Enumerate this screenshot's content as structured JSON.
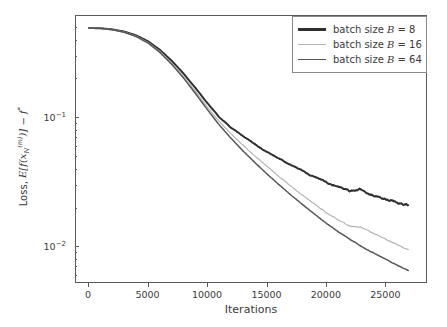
{
  "chart_data": {
    "type": "line",
    "title": "",
    "xlabel": "Iterations",
    "ylabel": "Loss, E[f(x_N^(m))] - f*",
    "ylabel_parts": {
      "prefix": "Loss, ",
      "expectation": "E",
      "fn": "f",
      "var": "x",
      "var_sub": "N",
      "var_sup": "(m)",
      "minus": " − ",
      "optimum": "f",
      "optimum_sup": "*"
    },
    "xscale": "linear",
    "yscale": "log",
    "xlim": [
      -1100,
      28500
    ],
    "ylim": [
      0.0052,
      0.62
    ],
    "grid": false,
    "legend_position": "upper right",
    "xticks": [
      0,
      5000,
      10000,
      15000,
      20000,
      25000
    ],
    "xticklabels": [
      "0",
      "5000",
      "10000",
      "15000",
      "20000",
      "25000"
    ],
    "yticks": [
      0.1,
      0.01
    ],
    "yticklabels": [
      "10−1",
      "10−2"
    ],
    "yticklabel_base": "10",
    "ytick_exponents": [
      "-1",
      "-2"
    ],
    "yminorticks": [
      0.5,
      0.4,
      0.3,
      0.2,
      0.09,
      0.08,
      0.07,
      0.06,
      0.05,
      0.04,
      0.03,
      0.02,
      0.009,
      0.008,
      0.007,
      0.006
    ],
    "series": [
      {
        "name": "batch size B = 8",
        "label_prefix": "batch size ",
        "label_symbol": "B",
        "label_suffix": " = 8",
        "color": "#2f2f2f",
        "width": 2.0,
        "x": [
          0,
          1000,
          2000,
          3000,
          4000,
          5000,
          6000,
          7000,
          8000,
          9000,
          10000,
          11000,
          12000,
          13000,
          14000,
          15000,
          16000,
          17000,
          18000,
          19000,
          20000,
          21000,
          22000,
          23000,
          24000,
          25000,
          26000,
          27000
        ],
        "y": [
          0.5,
          0.497,
          0.487,
          0.468,
          0.437,
          0.393,
          0.337,
          0.277,
          0.22,
          0.17,
          0.13,
          0.101,
          0.0835,
          0.072,
          0.062,
          0.054,
          0.048,
          0.0432,
          0.0385,
          0.0347,
          0.0315,
          0.0288,
          0.0268,
          0.0272,
          0.0248,
          0.0232,
          0.0218,
          0.0207
        ]
      },
      {
        "name": "batch size B = 16",
        "label_prefix": "batch size ",
        "label_symbol": "B",
        "label_suffix": " = 16",
        "color": "#b4b4b4",
        "width": 1.2,
        "x": [
          0,
          1000,
          2000,
          3000,
          4000,
          5000,
          6000,
          7000,
          8000,
          9000,
          10000,
          11000,
          12000,
          13000,
          14000,
          15000,
          16000,
          17000,
          18000,
          19000,
          20000,
          21000,
          22000,
          23000,
          24000,
          25000,
          26000,
          27000
        ],
        "y": [
          0.5,
          0.496,
          0.485,
          0.464,
          0.431,
          0.385,
          0.327,
          0.266,
          0.209,
          0.16,
          0.121,
          0.0935,
          0.0745,
          0.061,
          0.0505,
          0.042,
          0.035,
          0.0295,
          0.025,
          0.0213,
          0.0183,
          0.016,
          0.0142,
          0.014,
          0.0125,
          0.0113,
          0.0102,
          0.0092
        ]
      },
      {
        "name": "batch size B = 64",
        "label_prefix": "batch size ",
        "label_symbol": "B",
        "label_suffix": " = 64",
        "color": "#555555",
        "width": 1.5,
        "x": [
          0,
          1000,
          2000,
          3000,
          4000,
          5000,
          6000,
          7000,
          8000,
          9000,
          10000,
          11000,
          12000,
          13000,
          14000,
          15000,
          16000,
          17000,
          18000,
          19000,
          20000,
          21000,
          22000,
          23000,
          24000,
          25000,
          26000,
          27000
        ],
        "y": [
          0.5,
          0.496,
          0.484,
          0.462,
          0.428,
          0.381,
          0.322,
          0.26,
          0.203,
          0.154,
          0.1155,
          0.088,
          0.069,
          0.0552,
          0.0448,
          0.0367,
          0.0303,
          0.0252,
          0.0211,
          0.0178,
          0.0151,
          0.013,
          0.0113,
          0.0099,
          0.0088,
          0.0079,
          0.0071,
          0.0064
        ]
      }
    ]
  },
  "legend": {
    "items": [
      {
        "prefix": "batch size ",
        "symbol": "B",
        "suffix": " = 8"
      },
      {
        "prefix": "batch size ",
        "symbol": "B",
        "suffix": " = 16"
      },
      {
        "prefix": "batch size ",
        "symbol": "B",
        "suffix": " = 64"
      }
    ]
  },
  "axes": {
    "xlabel": "Iterations",
    "ylabel_prefix": "Loss, ",
    "ylabel_minus": " − ",
    "ytick_top_base": "10",
    "ytick_top_exp": "−1",
    "ytick_bottom_base": "10",
    "ytick_bottom_exp": "−2"
  },
  "colors": {
    "axis": "#5a5a5a",
    "text": "#3a3a3a",
    "background": "#ffffff",
    "series_b8": "#2f2f2f",
    "series_b16": "#b4b4b4",
    "series_b64": "#555555"
  }
}
